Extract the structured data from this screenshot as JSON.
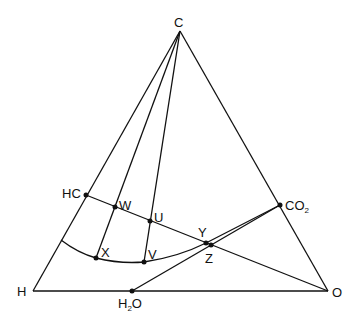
{
  "diagram": {
    "type": "ternary-composition-diagram",
    "vertices": {
      "C": {
        "label": "C",
        "x": 180,
        "y": 31
      },
      "H": {
        "label": "H",
        "x": 33,
        "y": 291
      },
      "O": {
        "label": "O",
        "x": 328,
        "y": 291
      }
    },
    "points": {
      "HC": {
        "label": "HC",
        "x": 86,
        "y": 195
      },
      "W": {
        "label": "W",
        "x": 115,
        "y": 207
      },
      "U": {
        "label": "U",
        "x": 150,
        "y": 221
      },
      "X": {
        "label": "X",
        "x": 96,
        "y": 258
      },
      "V": {
        "label": "V",
        "x": 144,
        "y": 262
      },
      "Y": {
        "label": "Y",
        "x": 206,
        "y": 243
      },
      "Z": {
        "label": "Z",
        "x": 211,
        "y": 245
      },
      "CO2": {
        "label_main": "CO",
        "label_sub": "2",
        "x": 280,
        "y": 205
      },
      "H2O": {
        "label_main": "H",
        "label_sub": "2",
        "label_tail": "O",
        "x": 132,
        "y": 291
      }
    },
    "lines": [
      {
        "from": "C",
        "to": "H"
      },
      {
        "from": "C",
        "to": "O"
      },
      {
        "from": "H",
        "to": "O"
      },
      {
        "from": "C",
        "to": "X"
      },
      {
        "from": "C",
        "to": "V"
      },
      {
        "from": "HC",
        "to": "O"
      },
      {
        "from": "H2O",
        "to": "CO2"
      },
      {
        "from": "Y",
        "to": "CO2"
      }
    ],
    "curve": {
      "description": "curved boundary from HC edge through X, V to CO2",
      "start": {
        "x": 61,
        "y": 240
      }
    }
  }
}
